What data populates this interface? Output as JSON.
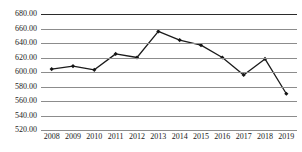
{
  "chart_data": {
    "type": "line",
    "title": "",
    "subtitle": "",
    "xlabel": "",
    "ylabel": "",
    "categories": [
      "2008",
      "2009",
      "2010",
      "2011",
      "2012",
      "2013",
      "2014",
      "2015",
      "2016",
      "2017",
      "2018",
      "2019"
    ],
    "values": [
      604,
      608,
      603,
      625,
      620,
      656,
      644,
      637,
      620,
      596,
      618,
      570
    ],
    "series": [
      {
        "name": "",
        "values": [
          604,
          608,
          603,
          625,
          620,
          656,
          644,
          637,
          620,
          596,
          618,
          570
        ]
      }
    ],
    "ylim": [
      520,
      680
    ],
    "ytick_step": 20,
    "ytick_labels": [
      "680.00",
      "660.00",
      "640.00",
      "620.00",
      "600.00",
      "580.00",
      "560.00",
      "540.00",
      "520.00"
    ],
    "ytick_values": [
      680,
      660,
      640,
      620,
      600,
      580,
      560,
      540,
      520
    ],
    "grid": true,
    "grid_axis": "y",
    "legend": false,
    "legend_position": "none",
    "markers": true,
    "marker_shape": "diamond",
    "line_color": "#1b1b1b",
    "marker_color": "#151515",
    "grid_color": "#8c8c8c",
    "background_color": "#ffffff"
  },
  "colors": {
    "line": "#1b1b1b",
    "marker": "#151515",
    "grid": "#8c8c8c",
    "text": "#1a1a1a",
    "background": "#ffffff"
  }
}
